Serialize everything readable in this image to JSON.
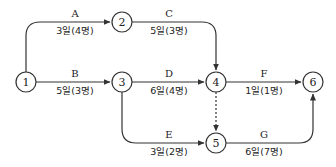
{
  "diagram": {
    "type": "activity-on-arrow network",
    "nodes": [
      {
        "id": "1",
        "label": "1"
      },
      {
        "id": "2",
        "label": "2"
      },
      {
        "id": "3",
        "label": "3"
      },
      {
        "id": "4",
        "label": "4"
      },
      {
        "id": "5",
        "label": "5"
      },
      {
        "id": "6",
        "label": "6"
      }
    ],
    "activities": [
      {
        "name": "A",
        "from": "1",
        "to": "2",
        "info": "3일(4명)"
      },
      {
        "name": "B",
        "from": "1",
        "to": "3",
        "info": "5일(3명)"
      },
      {
        "name": "C",
        "from": "2",
        "to": "4",
        "info": "5일(3명)"
      },
      {
        "name": "D",
        "from": "3",
        "to": "4",
        "info": "6일(4명)"
      },
      {
        "name": "E",
        "from": "3",
        "to": "5",
        "info": "3일(2명)"
      },
      {
        "name": "F",
        "from": "4",
        "to": "6",
        "info": "1일(1명)"
      },
      {
        "name": "G",
        "from": "5",
        "to": "6",
        "info": "6일(7명)"
      }
    ],
    "dummy_activities": [
      {
        "from": "4",
        "to": "5",
        "style": "dashed"
      }
    ],
    "colors": {
      "line": "#333333",
      "text": "#222222",
      "background": "#ffffff"
    }
  }
}
